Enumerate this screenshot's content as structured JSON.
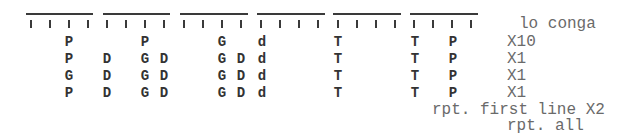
{
  "score": {
    "instrument_label": "lo conga",
    "colors": {
      "lines": "#3a3a3a",
      "hits": "#333333",
      "labels": "#6a6a6a"
    },
    "measures": [
      {
        "line_x": 26,
        "line_w": 67,
        "ticks": [
          31,
          50,
          69,
          88
        ]
      },
      {
        "line_x": 103,
        "line_w": 67,
        "ticks": [
          107,
          126,
          145,
          164
        ]
      },
      {
        "line_x": 180,
        "line_w": 68,
        "ticks": [
          184,
          203,
          222,
          241
        ]
      },
      {
        "line_x": 257,
        "line_w": 68,
        "ticks": [
          261,
          280,
          299,
          318
        ]
      },
      {
        "line_x": 333,
        "line_w": 68,
        "ticks": [
          338,
          357,
          376,
          395
        ]
      },
      {
        "line_x": 410,
        "line_w": 68,
        "ticks": [
          414,
          433,
          452,
          471
        ]
      }
    ],
    "rows": [
      {
        "repeat": "X10",
        "hits": [
          {
            "x": 69,
            "char": "P"
          },
          {
            "x": 145,
            "char": "P"
          },
          {
            "x": 222,
            "char": "G"
          },
          {
            "x": 262,
            "char": "d"
          },
          {
            "x": 338,
            "char": "T"
          },
          {
            "x": 415,
            "char": "T"
          },
          {
            "x": 453,
            "char": "P"
          }
        ]
      },
      {
        "repeat": "X1",
        "hits": [
          {
            "x": 69,
            "char": "P"
          },
          {
            "x": 107,
            "char": "D"
          },
          {
            "x": 145,
            "char": "G"
          },
          {
            "x": 164,
            "char": "D"
          },
          {
            "x": 222,
            "char": "G"
          },
          {
            "x": 241,
            "char": "D"
          },
          {
            "x": 262,
            "char": "d"
          },
          {
            "x": 338,
            "char": "T"
          },
          {
            "x": 415,
            "char": "T"
          },
          {
            "x": 453,
            "char": "P"
          }
        ]
      },
      {
        "repeat": "X1",
        "hits": [
          {
            "x": 69,
            "char": "G"
          },
          {
            "x": 107,
            "char": "D"
          },
          {
            "x": 145,
            "char": "G"
          },
          {
            "x": 164,
            "char": "D"
          },
          {
            "x": 222,
            "char": "G"
          },
          {
            "x": 241,
            "char": "D"
          },
          {
            "x": 262,
            "char": "d"
          },
          {
            "x": 338,
            "char": "T"
          },
          {
            "x": 415,
            "char": "T"
          },
          {
            "x": 453,
            "char": "P"
          }
        ]
      },
      {
        "repeat": "X1",
        "hits": [
          {
            "x": 69,
            "char": "P"
          },
          {
            "x": 107,
            "char": "D"
          },
          {
            "x": 145,
            "char": "G"
          },
          {
            "x": 164,
            "char": "D"
          },
          {
            "x": 222,
            "char": "G"
          },
          {
            "x": 241,
            "char": "D"
          },
          {
            "x": 262,
            "char": "d"
          },
          {
            "x": 338,
            "char": "T"
          },
          {
            "x": 415,
            "char": "T"
          },
          {
            "x": 453,
            "char": "P"
          }
        ]
      }
    ],
    "notes": {
      "repeat_first_line": "rpt. first line X2",
      "repeat_all": "rpt. all"
    }
  }
}
